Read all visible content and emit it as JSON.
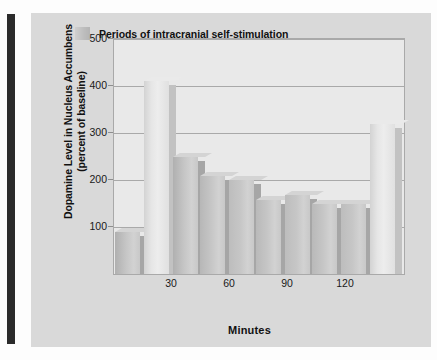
{
  "figure": {
    "background_color": "#d9d9d9",
    "plot_background_color": "#e9e9e9",
    "spine_color": "#2b2b2b"
  },
  "legend": {
    "swatch_name": "legend-swatch",
    "label": "Periods of intracranial self-stimulation"
  },
  "chart_data": {
    "type": "bar",
    "title": "",
    "xlabel": "Minutes",
    "ylabel": "Dopamine Level in Nucleus Accumbens (percent of baseline)",
    "ylabel_line1": "Dopamine Level in Nucleus Accumbens",
    "ylabel_line2": "(percent of baseline)",
    "ylim": [
      0,
      500
    ],
    "yticks": [
      100,
      200,
      300,
      400,
      500
    ],
    "ytick_labels": [
      "100",
      "200",
      "300",
      "400",
      "500"
    ],
    "xticks": [
      30,
      60,
      90,
      120
    ],
    "xtick_labels": [
      "30",
      "60",
      "90",
      "120"
    ],
    "xlim": [
      0,
      150
    ],
    "grid": true,
    "legend_position": "upper-center",
    "bar_width_minutes": 13,
    "categories": [
      "0",
      "15",
      "30",
      "45",
      "60",
      "75",
      "90",
      "105",
      "120",
      "135"
    ],
    "values": [
      90,
      410,
      248,
      208,
      200,
      158,
      168,
      148,
      150,
      320
    ],
    "series": [
      {
        "name": "Dopamine level (percent of baseline)",
        "values": [
          90,
          410,
          248,
          208,
          200,
          158,
          168,
          148,
          150,
          320
        ]
      }
    ],
    "bars": [
      {
        "x_center": 7,
        "value": 90,
        "stimulation": false,
        "color": "#b0b0b0"
      },
      {
        "x_center": 22,
        "value": 410,
        "stimulation": true,
        "color": "#dcdcdc"
      },
      {
        "x_center": 37,
        "value": 248,
        "stimulation": false,
        "color": "#b0b0b0"
      },
      {
        "x_center": 51,
        "value": 208,
        "stimulation": false,
        "color": "#b7b7b7"
      },
      {
        "x_center": 66,
        "value": 200,
        "stimulation": false,
        "color": "#bdbdbd"
      },
      {
        "x_center": 80,
        "value": 158,
        "stimulation": false,
        "color": "#b9b9b9"
      },
      {
        "x_center": 95,
        "value": 168,
        "stimulation": false,
        "color": "#bdbdbd"
      },
      {
        "x_center": 109,
        "value": 148,
        "stimulation": false,
        "color": "#b9b9b9"
      },
      {
        "x_center": 124,
        "value": 150,
        "stimulation": false,
        "color": "#bdbdbd"
      },
      {
        "x_center": 139,
        "value": 320,
        "stimulation": true,
        "color": "#dcdcdc"
      }
    ],
    "colors": {
      "stimulation_bar": "#dcdcdc",
      "normal_bar": "#b5b5b5",
      "gridline": "#a9a9a9",
      "axis_text": "#1a1a1a"
    }
  }
}
